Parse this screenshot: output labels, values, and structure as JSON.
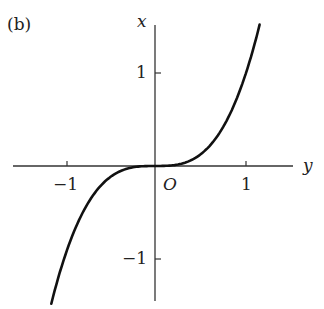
{
  "figure": {
    "panel_label": "(b)",
    "x_axis_name": "y",
    "y_axis_name": "x",
    "origin_label": "O",
    "horizontal_ticks": [
      "−1",
      "1"
    ],
    "vertical_ticks": [
      "1",
      "−1"
    ],
    "curve": "x = y^3"
  },
  "chart_data": {
    "type": "line",
    "title": "(b)",
    "xlabel": "y",
    "ylabel": "x",
    "x_ticks": [
      -1,
      1
    ],
    "y_ticks": [
      -1,
      1
    ],
    "xlim": [
      -1.55,
      1.5
    ],
    "ylim": [
      -1.5,
      1.5
    ],
    "grid": false,
    "series": [
      {
        "name": "x = y^3",
        "x": [
          -1.14,
          -1.0,
          -0.8,
          -0.6,
          -0.4,
          -0.2,
          0,
          0.2,
          0.4,
          0.6,
          0.8,
          1.0,
          1.15
        ],
        "y": [
          -1.48,
          -1.0,
          -0.51,
          -0.22,
          -0.06,
          -0.01,
          0,
          0.01,
          0.06,
          0.22,
          0.51,
          1.0,
          1.52
        ]
      }
    ]
  }
}
